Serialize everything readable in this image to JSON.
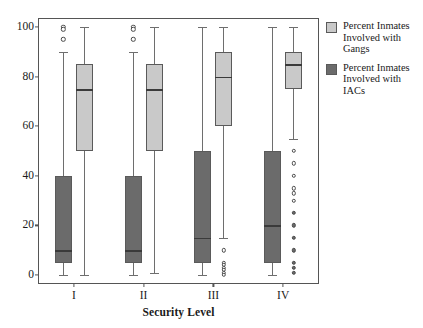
{
  "chart_data": {
    "type": "box",
    "title": "",
    "xlabel": "Security Level",
    "ylabel": "",
    "categories": [
      "I",
      "II",
      "III",
      "IV"
    ],
    "ylim": [
      0,
      100
    ],
    "yticks": [
      0,
      20,
      40,
      60,
      80,
      100
    ],
    "grid": false,
    "legend_position": "right",
    "series": [
      {
        "name": "Percent Inmates Involved with IACs",
        "color": "#6b6b6b",
        "boxes": [
          {
            "category": "I",
            "whisker_low": 0,
            "q1": 5,
            "median": 10,
            "q3": 40,
            "whisker_high": 90,
            "outliers": [
              100,
              99,
              95
            ]
          },
          {
            "category": "II",
            "whisker_low": 0,
            "q1": 5,
            "median": 10,
            "q3": 40,
            "whisker_high": 90,
            "outliers": [
              100,
              99,
              95
            ]
          },
          {
            "category": "III",
            "whisker_low": 0,
            "q1": 5,
            "median": 15,
            "q3": 50,
            "whisker_high": 100,
            "outliers": []
          },
          {
            "category": "IV",
            "whisker_low": 0,
            "q1": 5,
            "median": 20,
            "q3": 50,
            "whisker_high": 100,
            "outliers": []
          }
        ]
      },
      {
        "name": "Percent Inmates Involved with Gangs",
        "color": "#c9c9c9",
        "boxes": [
          {
            "category": "I",
            "whisker_low": 0,
            "q1": 50,
            "median": 75,
            "q3": 85,
            "whisker_high": 100,
            "outliers": []
          },
          {
            "category": "II",
            "whisker_low": 1,
            "q1": 50,
            "median": 75,
            "q3": 85,
            "whisker_high": 100,
            "outliers": []
          },
          {
            "category": "III",
            "whisker_low": 15,
            "q1": 60,
            "median": 80,
            "q3": 90,
            "whisker_high": 100,
            "outliers": [
              10,
              5,
              4,
              3,
              2,
              1,
              0
            ]
          },
          {
            "category": "IV",
            "whisker_low": 55,
            "q1": 75,
            "median": 85,
            "q3": 90,
            "whisker_high": 100,
            "outliers": [
              50,
              45,
              40,
              35,
              33,
              30,
              25,
              20,
              15,
              10,
              5,
              3,
              1
            ]
          }
        ]
      }
    ]
  },
  "legend": {
    "items": [
      {
        "label_line1": "Percent Inmates",
        "label_line2": "Involved with Gangs",
        "swatch": "light"
      },
      {
        "label_line1": "Percent Inmates",
        "label_line2": "Involved with IACs",
        "swatch": "dark"
      }
    ]
  },
  "axis": {
    "x_title": "Security Level"
  }
}
